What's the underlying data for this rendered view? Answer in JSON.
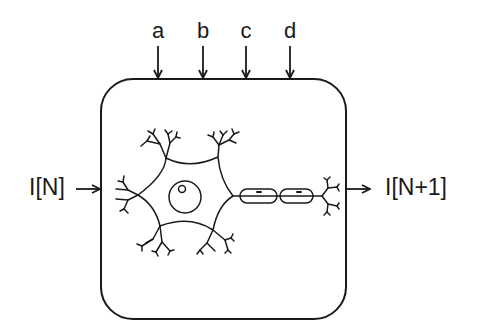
{
  "diagram": {
    "top_inputs": [
      {
        "label": "a"
      },
      {
        "label": "b"
      },
      {
        "label": "c"
      },
      {
        "label": "d"
      }
    ],
    "input": {
      "label": "I[N]"
    },
    "output": {
      "label": "I[N+1]"
    },
    "box": {
      "shape": "rounded-rectangle"
    },
    "neuron": {
      "parts": [
        "soma",
        "nucleus",
        "dendrites",
        "axon",
        "myelin-sheath",
        "axon-terminals"
      ]
    },
    "colors": {
      "stroke": "#1a1a1a",
      "background": "#ffffff"
    }
  }
}
